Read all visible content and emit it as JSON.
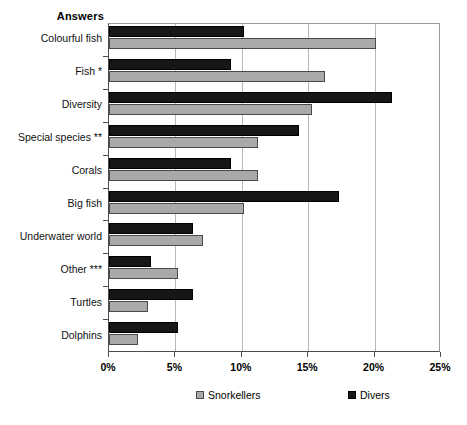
{
  "chart_data": {
    "type": "bar",
    "orientation": "horizontal",
    "title": "",
    "xlabel": "",
    "ylabel": "Answers",
    "xlim": [
      0,
      25
    ],
    "xticks": [
      "0%",
      "5%",
      "10%",
      "15%",
      "20%",
      "25%"
    ],
    "xtick_values": [
      0,
      5,
      10,
      15,
      20,
      25
    ],
    "grid": "vertical",
    "legend_position": "bottom",
    "categories": [
      "Colourful fish",
      "Fish *",
      "Diversity",
      "Special species **",
      "Corals",
      "Big fish",
      "Underwater world",
      "Other ***",
      "Turtles",
      "Dolphins"
    ],
    "series": [
      {
        "name": "Snorkellers",
        "color": "#a9a9a9",
        "values": [
          20.1,
          16.3,
          15.3,
          11.2,
          11.2,
          10.2,
          7.1,
          5.2,
          2.9,
          2.2
        ]
      },
      {
        "name": "Divers",
        "color": "#161616",
        "values": [
          10.2,
          9.2,
          21.3,
          14.3,
          9.2,
          17.3,
          6.3,
          3.2,
          6.3,
          5.2
        ]
      }
    ]
  },
  "legend": {
    "snorkellers_label": "Snorkellers",
    "divers_label": "Divers"
  }
}
